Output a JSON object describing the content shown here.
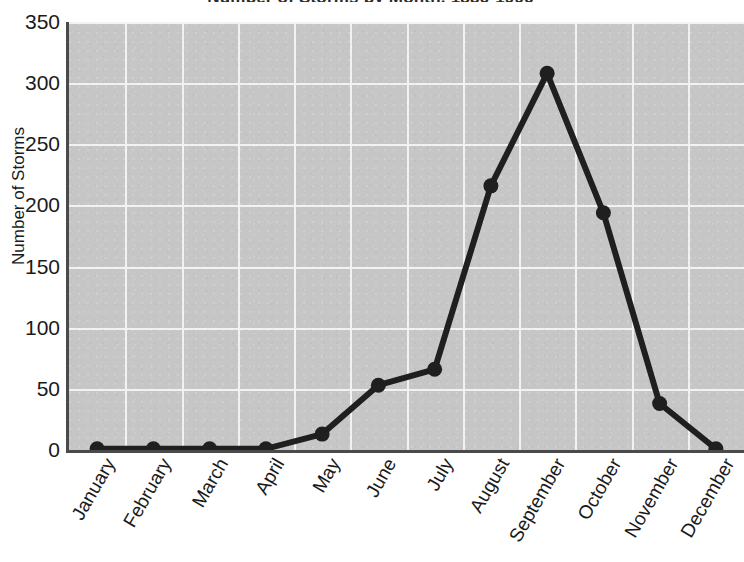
{
  "chart_data": {
    "type": "line",
    "title": "Number of Storms by Month, 1886-1996",
    "xlabel": "",
    "ylabel": "Number of Storms",
    "categories": [
      "January",
      "February",
      "March",
      "April",
      "May",
      "June",
      "July",
      "August",
      "September",
      "October",
      "November",
      "December"
    ],
    "values": [
      1,
      1,
      1,
      1,
      13,
      53,
      66,
      216,
      308,
      194,
      38,
      1
    ],
    "series": [
      {
        "name": "Number of Storms",
        "values": [
          1,
          1,
          1,
          1,
          13,
          53,
          66,
          216,
          308,
          194,
          38,
          1
        ]
      }
    ],
    "ylim": [
      0,
      350
    ],
    "yticks": [
      0,
      50,
      100,
      150,
      200,
      250,
      300,
      350
    ],
    "ytick_labels": [
      "0",
      "50",
      "100",
      "150",
      "200",
      "250",
      "300",
      "350"
    ],
    "grid": true,
    "grid_color": "#f2f2f2",
    "plot_background": "#c6c6c6",
    "line_color": "#1f1f1f",
    "marker": "circle",
    "marker_color": "#1f1f1f",
    "legend": "none",
    "axis_color": "#4a4a4a"
  },
  "figure": {
    "title_clipped": true,
    "background": "#ffffff"
  }
}
